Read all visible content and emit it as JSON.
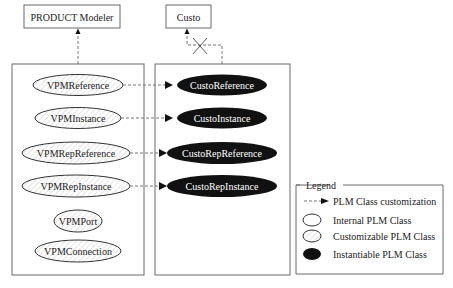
{
  "top_boxes": {
    "product_modeler": "PRODUCT Modeler",
    "custo": "Custo"
  },
  "left_panel": {
    "classes": [
      {
        "label": "VPMReference",
        "type": "customizable"
      },
      {
        "label": "VPMInstance",
        "type": "customizable"
      },
      {
        "label": "VPMRepReference",
        "type": "customizable"
      },
      {
        "label": "VPMRepInstance",
        "type": "customizable"
      },
      {
        "label": "VPMPort",
        "type": "customizable"
      },
      {
        "label": "VPMConnection",
        "type": "customizable"
      }
    ]
  },
  "middle_panel": {
    "classes": [
      {
        "label": "CustoReference",
        "type": "instantiable"
      },
      {
        "label": "CustoInstance",
        "type": "instantiable"
      },
      {
        "label": "CustoRepReference",
        "type": "instantiable"
      },
      {
        "label": "CustoRepInstance",
        "type": "instantiable"
      }
    ]
  },
  "legend": {
    "title": "Legend",
    "items": [
      {
        "label": "PLM Class customization",
        "symbol": "dashed-arrow"
      },
      {
        "label": "Internal PLM Class",
        "symbol": "white-ellipse"
      },
      {
        "label": "Customizable PLM Class",
        "symbol": "hatched-ellipse"
      },
      {
        "label": "Instantiable PLM Class",
        "symbol": "black-ellipse"
      }
    ]
  },
  "colors": {
    "instantiable_fill": "#111111",
    "border": "#6a6a6a",
    "hatch": "#cfcfcf"
  }
}
